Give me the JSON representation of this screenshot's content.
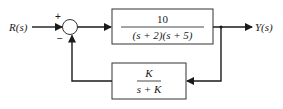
{
  "diagram": {
    "type": "feedback-block-diagram",
    "input": {
      "label": "R(s)"
    },
    "output": {
      "label": "Y(s)"
    },
    "summing_junction": {
      "plus_sign": "+",
      "minus_sign": "−"
    },
    "forward_block": {
      "numerator": "10",
      "denominator": "(s + 2)(s + 5)"
    },
    "feedback_block": {
      "numerator": "K",
      "denominator": "s + K"
    },
    "colors": {
      "line": "#1a1a1a",
      "background": "#ffffff",
      "box_border": "#333333"
    }
  }
}
